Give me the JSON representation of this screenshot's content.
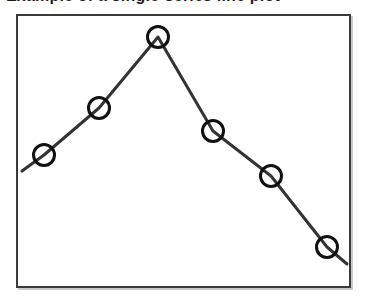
{
  "figure": {
    "clipped_title": "Example of a single-series line plot",
    "frame": {
      "x": 16,
      "y": 14,
      "width": 335,
      "height": 274,
      "border_color": "#3a3a3a",
      "shadow_color": "#c9c9c9",
      "background_color": "#ffffff"
    }
  },
  "chart_data": {
    "type": "line",
    "title": "",
    "subtitle": "",
    "xlabel": "",
    "ylabel": "",
    "grid": false,
    "legend": null,
    "legend_position": "none",
    "axis_ticks_visible": false,
    "axis_tick_labels": [],
    "xlim": [
      0,
      7
    ],
    "ylim": [
      0,
      10
    ],
    "categories": [
      "1",
      "2",
      "3",
      "4",
      "5",
      "6"
    ],
    "x": [
      1,
      2,
      3,
      4,
      5,
      6
    ],
    "values": [
      5.1,
      6.8,
      9.4,
      5.9,
      4.3,
      1.7
    ],
    "series": [
      {
        "name": "series-1",
        "values": [
          5.1,
          6.8,
          9.4,
          5.9,
          4.3,
          1.7
        ],
        "line_color": "#333333",
        "line_width": 3,
        "marker": "circle-open",
        "marker_size": 24,
        "marker_edge_color": "#111111",
        "marker_edge_width": 3,
        "marker_face_color": "none"
      }
    ],
    "pixel_points": [
      {
        "label": "1",
        "cx": 44,
        "cy": 155,
        "value": 5.1
      },
      {
        "label": "2",
        "cx": 99,
        "cy": 108,
        "value": 6.8
      },
      {
        "label": "3",
        "cx": 158,
        "cy": 37,
        "value": 9.4
      },
      {
        "label": "4",
        "cx": 213,
        "cy": 131,
        "value": 5.9
      },
      {
        "label": "5",
        "cx": 271,
        "cy": 176,
        "value": 4.3
      },
      {
        "label": "6",
        "cx": 327,
        "cy": 247,
        "value": 1.7
      }
    ],
    "line_path": "M 22,171 L 44,155 L 99,108 L 158,37 L 213,131 L 271,176 L 327,247 L 347,264",
    "annotations": []
  }
}
